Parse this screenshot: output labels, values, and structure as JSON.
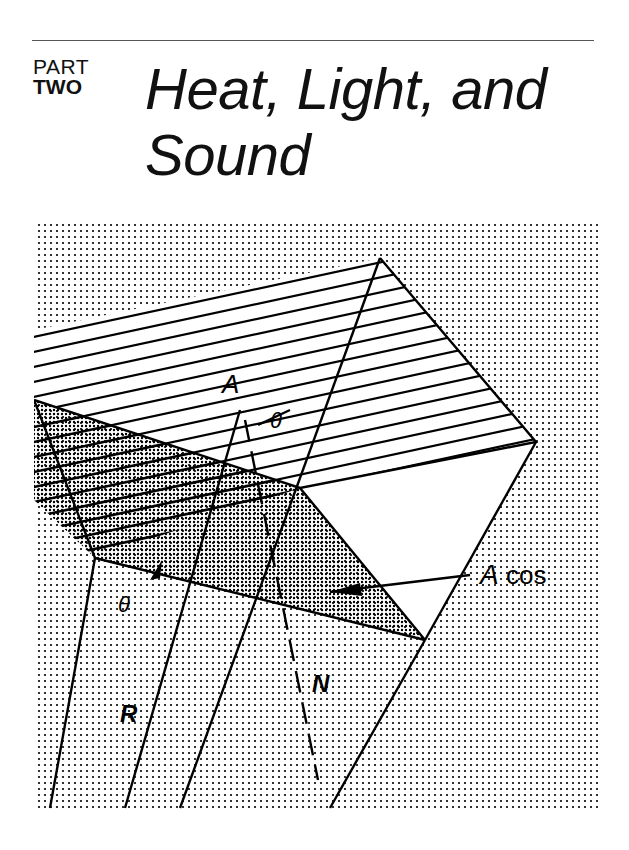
{
  "header": {
    "part_label": "PART",
    "part_number": "TWO",
    "title_line1": "Heat, Light, and",
    "title_line2": "Sound"
  },
  "figure": {
    "labels": {
      "area": "A",
      "angle_top": "θ",
      "angle_left": "θ",
      "angle_edge": "θ",
      "projected_area_var": "A",
      "projected_area_fn": "cos",
      "ray": "R",
      "normal": "N"
    }
  }
}
